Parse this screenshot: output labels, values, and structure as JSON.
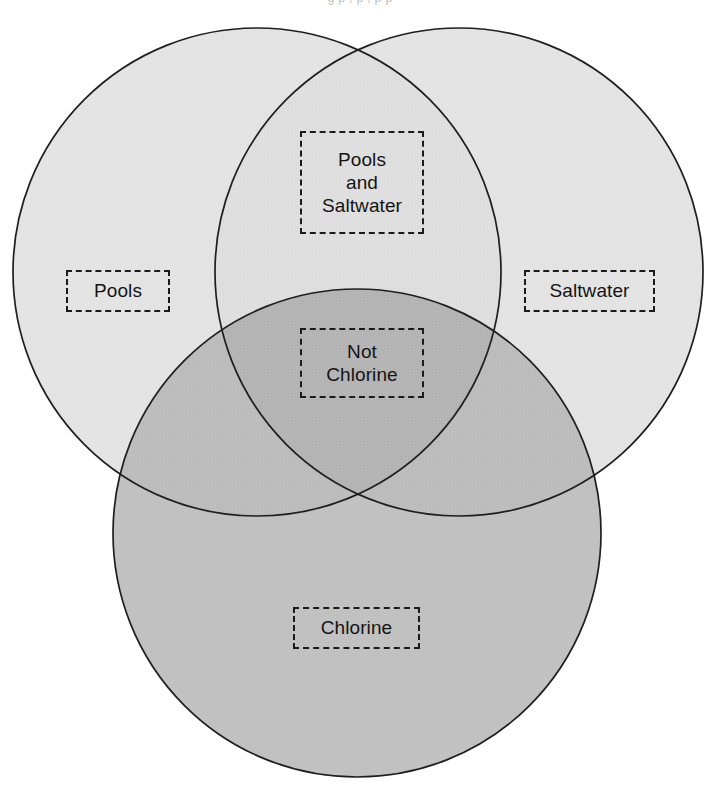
{
  "figure": {
    "type": "venn-diagram",
    "set_count": 3,
    "background_color": "#ffffff",
    "outline_color": "#1b1b1b",
    "top_partial_text": "g  p         ,    p ,                            p   p"
  },
  "chart_data": {
    "type": "venn",
    "title": "",
    "sets": [
      {
        "id": "pools",
        "label": "Pools",
        "position": "left",
        "fill": "#e2e2e2",
        "cx": 257,
        "cy": 272,
        "r": 244
      },
      {
        "id": "saltwater",
        "label": "Saltwater",
        "position": "right",
        "fill": "#e2e2e2",
        "cx": 459,
        "cy": 272,
        "r": 244
      },
      {
        "id": "chlorine",
        "label": "Chlorine",
        "position": "bottom",
        "fill": "#bdbdbd",
        "cx": 357,
        "cy": 533,
        "r": 244
      }
    ],
    "regions": [
      {
        "id": "pools-only",
        "label": "Pools",
        "members": [
          "pools"
        ],
        "shade": "#e2e2e2"
      },
      {
        "id": "saltwater-only",
        "label": "Saltwater",
        "members": [
          "saltwater"
        ],
        "shade": "#e2e2e2"
      },
      {
        "id": "chlorine-only",
        "label": "Chlorine",
        "members": [
          "chlorine"
        ],
        "shade": "#bdbdbd"
      },
      {
        "id": "pools-and-saltwater",
        "label": "Pools\nand\nSaltwater",
        "members": [
          "pools",
          "saltwater"
        ],
        "shade": "#dcdcdc"
      },
      {
        "id": "not-chlorine",
        "label": "Not\nChlorine",
        "members": [
          "pools",
          "saltwater",
          "chlorine"
        ],
        "shade": "#a9a9a9"
      }
    ],
    "legend": null,
    "grid": false
  },
  "labels": {
    "pools": "Pools",
    "saltwater": "Saltwater",
    "pools_and_saltwater": "Pools\nand\nSaltwater",
    "not_chlorine": "Not\nChlorine",
    "chlorine": "Chlorine"
  },
  "colors": {
    "single_light": "#e2e2e2",
    "double_light": "#dcdcdc",
    "chlorine_mid": "#bdbdbd",
    "triple_dark": "#a9a9a9",
    "stroke": "#1b1b1b",
    "label_text": "#141414",
    "page_background": "#ffffff"
  }
}
